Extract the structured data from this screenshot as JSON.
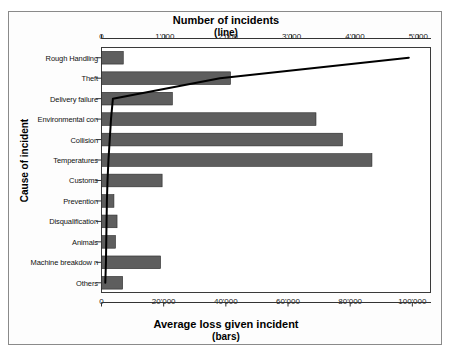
{
  "chart_data": {
    "type": "bar",
    "title": "",
    "orientation": "horizontal",
    "top_axis": {
      "label_line1": "Number of incidents",
      "label_line2": "(line)",
      "ticks": [
        0,
        1000,
        2000,
        3000,
        4000,
        5000
      ],
      "tick_labels": [
        "0",
        "1'000",
        "2'000",
        "3'000",
        "4'000",
        "5'000"
      ],
      "range": [
        0,
        5200
      ]
    },
    "bottom_axis": {
      "label_line1": "Average loss given incident",
      "label_line2": "(bars)",
      "ticks": [
        0,
        20000,
        40000,
        60000,
        80000,
        100000
      ],
      "tick_labels": [
        "0",
        "20'000",
        "40'000",
        "60'000",
        "80'000",
        "100'000"
      ],
      "range": [
        0,
        106000
      ]
    },
    "ylabel": "Cause of incident",
    "categories": [
      "Rough Handling",
      "Theft",
      "Delivery failure",
      "Environmental con",
      "Collision",
      "Temperatures",
      "Customs",
      "Prevention",
      "Disqualification",
      "Animals",
      "Machine breakdow n",
      "Others"
    ],
    "series": [
      {
        "name": "Average loss given incident",
        "axis": "bottom",
        "render": "bars",
        "color": "#5e5e5e",
        "values": [
          7000,
          41500,
          22800,
          69000,
          77500,
          87000,
          19500,
          4000,
          5000,
          4500,
          19000,
          6800
        ]
      },
      {
        "name": "Number of incidents",
        "axis": "top",
        "render": "line",
        "color": "#000000",
        "values": [
          4850,
          1870,
          180,
          150,
          130,
          110,
          95,
          85,
          80,
          75,
          70,
          60
        ]
      }
    ],
    "grid": false,
    "legend": "none"
  },
  "axes": {
    "top_tick_labels": [
      "0",
      "1'000",
      "2'000",
      "3'000",
      "4'000",
      "5'000"
    ],
    "bottom_tick_labels": [
      "0",
      "20'000",
      "40'000",
      "60'000",
      "80'000",
      "100'000"
    ],
    "top_title_main": "Number of incidents",
    "top_title_sub": "(line)",
    "bottom_title_main": "Average loss given incident",
    "bottom_title_sub": "(bars)",
    "y_title": "Cause of incident"
  },
  "colors": {
    "bar_fill": "#5e5e5e",
    "line": "#000000",
    "frame": "#3a3a3a",
    "outer_frame": "#8a8a8a",
    "background": "#ffffff"
  }
}
